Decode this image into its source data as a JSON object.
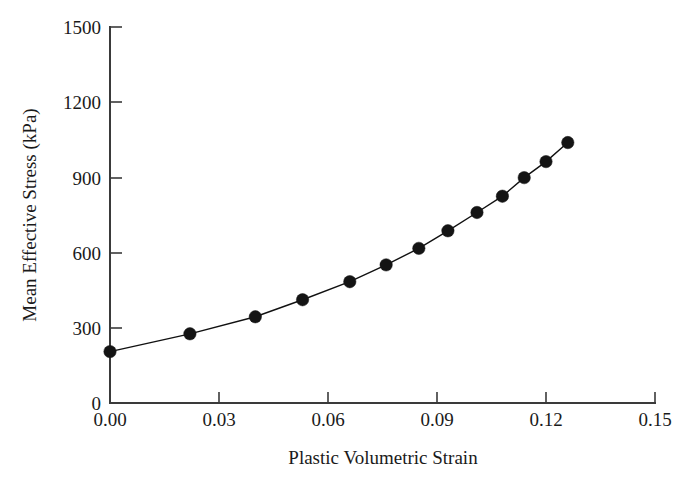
{
  "chart_data": {
    "type": "line",
    "title": "",
    "xlabel": "Plastic Volumetric Strain",
    "ylabel": "Mean Effective Stress (kPa)",
    "xlim": [
      0.0,
      0.15
    ],
    "ylim": [
      0,
      1500
    ],
    "xticks": [
      0.0,
      0.03,
      0.06,
      0.09,
      0.12,
      0.15
    ],
    "xtick_labels": [
      "0.00",
      "0.03",
      "0.06",
      "0.09",
      "0.12",
      "0.15"
    ],
    "yticks": [
      0,
      300,
      600,
      900,
      1200,
      1500
    ],
    "ytick_labels": [
      "0",
      "300",
      "600",
      "900",
      "1200",
      "1500"
    ],
    "grid": false,
    "legend": null,
    "marker": "filled-circle",
    "series": [
      {
        "name": "Mean Effective Stress",
        "x": [
          0.0,
          0.022,
          0.04,
          0.053,
          0.066,
          0.076,
          0.085,
          0.093,
          0.101,
          0.108,
          0.114,
          0.12,
          0.126
        ],
        "y": [
          205,
          276,
          344,
          412,
          484,
          551,
          617,
          687,
          760,
          825,
          899,
          963,
          1039
        ]
      }
    ]
  },
  "axes": {
    "y_tick_text": {
      "t0": "0",
      "t300": "300",
      "t600": "600",
      "t900": "900",
      "t1200": "1200",
      "t1500": "1500"
    },
    "x_tick_text": {
      "t000": "0.00",
      "t003": "0.03",
      "t006": "0.06",
      "t009": "0.09",
      "t012": "0.12",
      "t015": "0.15"
    },
    "x_axis_title": "Plastic Volumetric Strain",
    "y_axis_title": "Mean Effective Stress (kPa)"
  },
  "colors": {
    "background": "#ffffff",
    "axis": "#3a3a3a",
    "line": "#111111",
    "marker": "#141414",
    "text": "#1a1a1a"
  }
}
